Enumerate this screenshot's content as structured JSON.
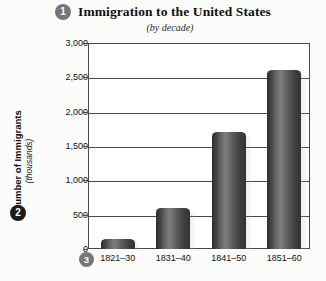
{
  "header": {
    "badge": "1",
    "title": "Immigration to the United States",
    "subtitle": "(by decade)"
  },
  "y_axis": {
    "badge": "2",
    "title": "Number of Immigrants",
    "units": "(thousands)"
  },
  "x_axis": {
    "badge": "3"
  },
  "colors": {
    "badge_gray": "#767676",
    "badge_dark": "#1b1b1b",
    "bar_dark": "#333333",
    "bar_light": "#7d7d7d",
    "axis": "#4a4a4a",
    "plot_background": "#ffffff",
    "page_background": "#fbfbfa"
  },
  "chart_data": {
    "type": "bar",
    "title": "Immigration to the United States",
    "subtitle": "(by decade)",
    "xlabel": "",
    "ylabel": "Number of Immigrants (thousands)",
    "categories": [
      "1821–30",
      "1831–40",
      "1841–50",
      "1851–60"
    ],
    "values": [
      150,
      600,
      1700,
      2600
    ],
    "ylim": [
      0,
      3000
    ],
    "ytick_labels": [
      "0",
      "500",
      "1,000",
      "1,500",
      "2,000",
      "2,500",
      "3,000"
    ],
    "ytick_values": [
      0,
      500,
      1000,
      1500,
      2000,
      2500,
      3000
    ],
    "grid": true,
    "legend": false
  }
}
